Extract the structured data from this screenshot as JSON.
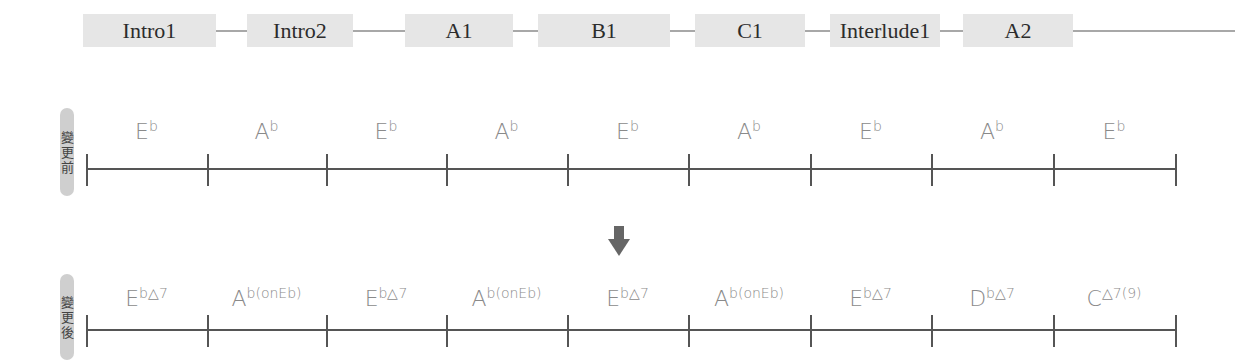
{
  "sections": [
    "Intro1",
    "Intro2",
    "A1",
    "B1",
    "C1",
    "Interlude1",
    "A2"
  ],
  "rows": {
    "before": {
      "label": [
        "變",
        "更",
        "前"
      ],
      "chords": [
        {
          "root": "E",
          "sup": "b"
        },
        {
          "root": "A",
          "sup": "b"
        },
        {
          "root": "E",
          "sup": "b"
        },
        {
          "root": "A",
          "sup": "b"
        },
        {
          "root": "E",
          "sup": "b"
        },
        {
          "root": "A",
          "sup": "b"
        },
        {
          "root": "E",
          "sup": "b"
        },
        {
          "root": "A",
          "sup": "b"
        },
        {
          "root": "E",
          "sup": "b"
        }
      ]
    },
    "after": {
      "label": [
        "變",
        "更",
        "後"
      ],
      "chords": [
        {
          "root": "E",
          "sup": "b△7"
        },
        {
          "root": "A",
          "sup": "b(onEb)"
        },
        {
          "root": "E",
          "sup": "b△7"
        },
        {
          "root": "A",
          "sup": "b(onEb)"
        },
        {
          "root": "E",
          "sup": "b△7"
        },
        {
          "root": "A",
          "sup": "b(onEb)"
        },
        {
          "root": "E",
          "sup": "b△7"
        },
        {
          "root": "D",
          "sup": "b△7"
        },
        {
          "root": "C",
          "sup": "△7(9)"
        }
      ]
    }
  },
  "arrow": "down-arrow",
  "colors": {
    "section_bg": "#e6e6e6",
    "label_bg": "#cfcfcf",
    "line": "#555555",
    "chord_text": "#8a8a8a",
    "arrow": "#666666"
  }
}
